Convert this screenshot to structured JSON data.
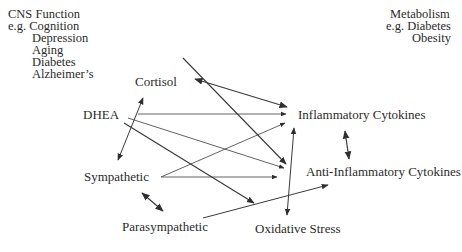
{
  "cns_box": {
    "title": "CNS Function",
    "prefix": "e.g.",
    "items": [
      "Cognition",
      "Depression",
      "Aging",
      "Diabetes",
      "Alzheimer’s"
    ]
  },
  "metabolism_box": {
    "title": "Metabolism",
    "prefix": "e.g.",
    "items": [
      "Diabetes",
      "Obesity"
    ]
  },
  "nodes": {
    "cortisol": "Cortisol",
    "dhea": "DHEA",
    "sympathetic": "Sympathetic",
    "parasympathetic": "Parasympathetic",
    "inflammatory": "Inflammatory Cytokines",
    "anti_inflammatory": "Anti-Inflammatory Cytokines",
    "oxidative": "Oxidative Stress"
  },
  "edges": [
    {
      "from": "Cortisol",
      "to": "Inflammatory Cytokines",
      "type": "bidirectional"
    },
    {
      "from": "Cortisol",
      "to": "Anti-Inflammatory Cytokines",
      "type": "directed"
    },
    {
      "from": "Cortisol",
      "to": "Sympathetic",
      "type": "bidirectional"
    },
    {
      "from": "DHEA",
      "to": "Inflammatory Cytokines",
      "type": "directed"
    },
    {
      "from": "DHEA",
      "to": "Anti-Inflammatory Cytokines",
      "type": "directed"
    },
    {
      "from": "DHEA",
      "to": "Oxidative Stress",
      "type": "directed"
    },
    {
      "from": "Sympathetic",
      "to": "Inflammatory Cytokines",
      "type": "directed"
    },
    {
      "from": "Sympathetic",
      "to": "Anti-Inflammatory Cytokines",
      "type": "directed"
    },
    {
      "from": "Sympathetic",
      "to": "Parasympathetic",
      "type": "bidirectional"
    },
    {
      "from": "Parasympathetic",
      "to": "Anti-Inflammatory Cytokines",
      "type": "directed"
    },
    {
      "from": "Inflammatory Cytokines",
      "to": "Anti-Inflammatory Cytokines",
      "type": "bidirectional"
    },
    {
      "from": "Inflammatory Cytokines",
      "to": "Oxidative Stress",
      "type": "bidirectional"
    }
  ],
  "colors": {
    "line": "#3a3a3a",
    "text": "#2a2a2a",
    "background": "#ffffff"
  }
}
